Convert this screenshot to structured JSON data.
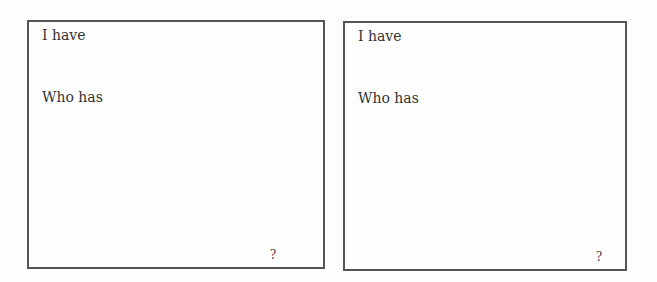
{
  "cards": [
    {
      "i_have_label": "I have",
      "who_has_label": "Who has",
      "answer": "?"
    },
    {
      "i_have_label": "I have",
      "who_has_label": "Who has",
      "answer": "?"
    }
  ]
}
